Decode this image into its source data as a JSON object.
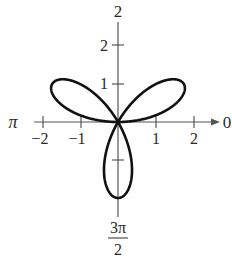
{
  "chart_data": {
    "type": "line",
    "coordinate_system": "polar",
    "title": "",
    "equation": "r = 2 sin(3θ)",
    "petals": 3,
    "petal_angles": [
      "π/6",
      "5π/6",
      "3π/2"
    ],
    "max_r": 2,
    "axis_labels": {
      "top": "2",
      "left": "π",
      "right": "0",
      "bottom_numerator": "3π",
      "bottom_denominator": "2"
    },
    "x_ticks": [
      "−2",
      "−1",
      "1",
      "2"
    ],
    "y_ticks": [
      "2",
      "1"
    ],
    "grid": false
  },
  "colors": {
    "curve": "#111111",
    "axis": "#555555",
    "text": "#2a2a2a"
  }
}
